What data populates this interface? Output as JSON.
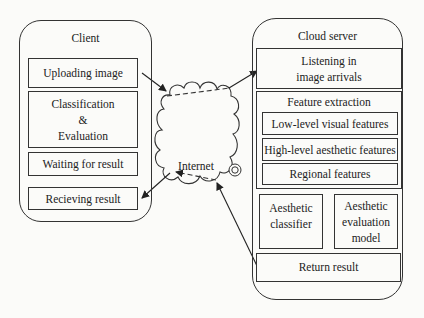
{
  "client": {
    "title": "Client",
    "steps": [
      {
        "label": "Uploading image"
      },
      {
        "label": "Classification\n&\nEvaluation"
      },
      {
        "label": "Waiting for result"
      },
      {
        "label": "Recieving result"
      }
    ]
  },
  "network": {
    "label": "Internet"
  },
  "server": {
    "title": "Cloud server",
    "listening": "Listening in\nimage arrivals",
    "feature_extraction": {
      "title": "Feature extraction",
      "items": [
        {
          "label": "Low-level visual features"
        },
        {
          "label": "High-level aesthetic features"
        },
        {
          "label": "Regional features"
        }
      ]
    },
    "classifier": "Aesthetic\nclassifier",
    "evaluation_model": "Aesthetic\nevaluation\nmodel",
    "return_result": "Return result"
  }
}
